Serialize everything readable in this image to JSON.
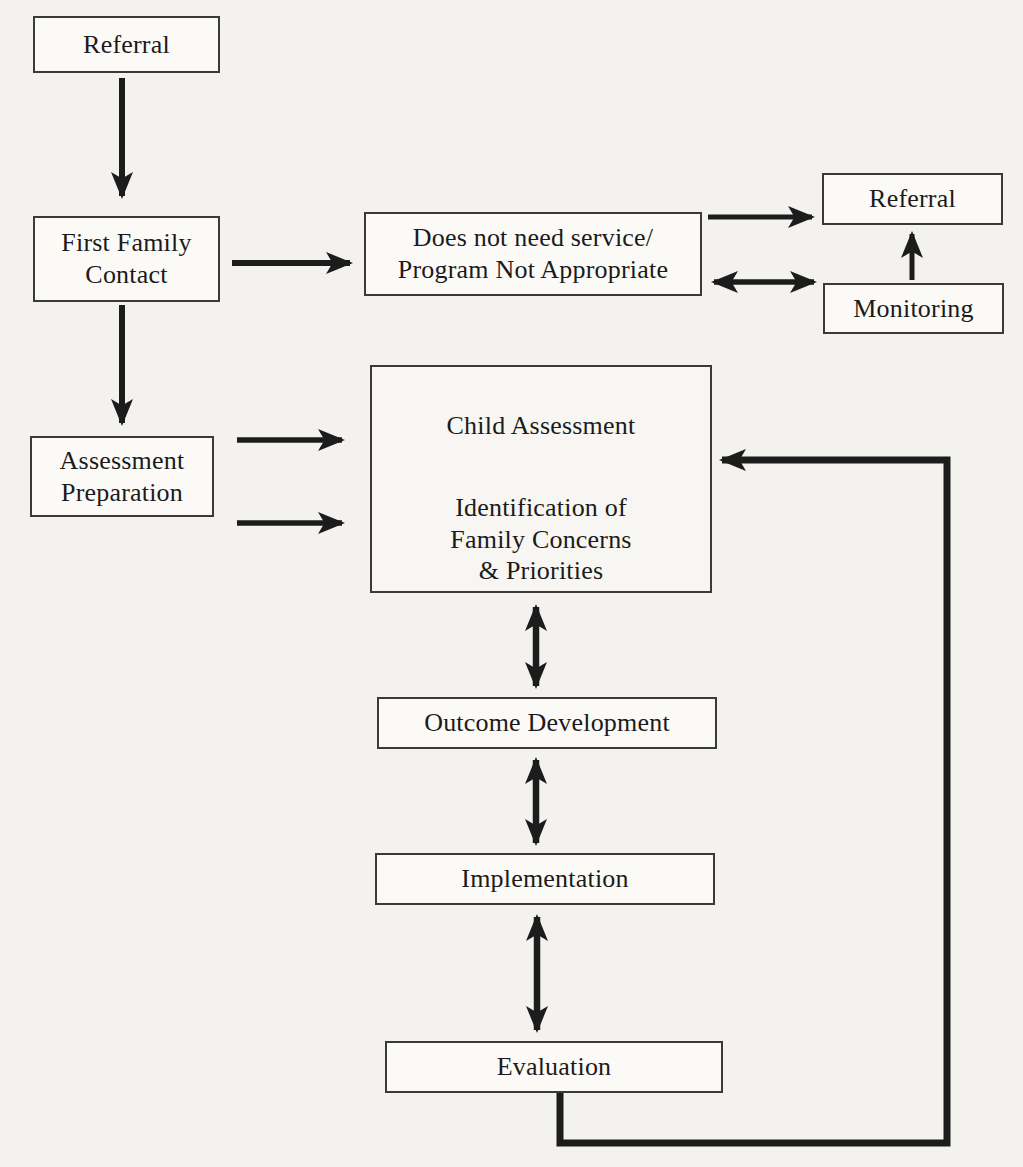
{
  "diagram": {
    "type": "flowchart",
    "colors": {
      "background": "#f3f2ee",
      "box_fill": "#fbfaf7",
      "box_border": "#3a3a38",
      "arrow": "#1c1c1c",
      "text": "#1b1b1b"
    },
    "nodes": {
      "referral_top": {
        "label": "Referral"
      },
      "first_family_contact": {
        "label": "First Family\nContact"
      },
      "does_not_need_service": {
        "label": "Does not need service/\nProgram Not Appropriate"
      },
      "referral_right": {
        "label": "Referral"
      },
      "monitoring": {
        "label": "Monitoring"
      },
      "assessment_preparation": {
        "label": "Assessment\nPreparation"
      },
      "child_assessment": {
        "label": "Child Assessment"
      },
      "family_concerns": {
        "label": "Identification of\nFamily Concerns\n& Priorities"
      },
      "outcome_development": {
        "label": "Outcome Development"
      },
      "implementation": {
        "label": "Implementation"
      },
      "evaluation": {
        "label": "Evaluation"
      }
    },
    "edges": [
      {
        "from": "referral_top",
        "to": "first_family_contact",
        "type": "single-arrow"
      },
      {
        "from": "first_family_contact",
        "to": "does_not_need_service",
        "type": "single-arrow"
      },
      {
        "from": "does_not_need_service",
        "to": "referral_right",
        "type": "single-arrow"
      },
      {
        "from": "does_not_need_service",
        "to": "monitoring",
        "type": "double-arrow"
      },
      {
        "from": "monitoring",
        "to": "referral_right",
        "type": "single-arrow"
      },
      {
        "from": "first_family_contact",
        "to": "assessment_preparation",
        "type": "single-arrow"
      },
      {
        "from": "assessment_preparation",
        "to": "assessment_group",
        "type": "single-arrow",
        "note": "upper arrow"
      },
      {
        "from": "assessment_preparation",
        "to": "assessment_group",
        "type": "single-arrow",
        "note": "lower arrow"
      },
      {
        "from": "child_assessment",
        "to": "family_concerns",
        "type": "double-arrow"
      },
      {
        "from": "assessment_group",
        "to": "outcome_development",
        "type": "double-arrow"
      },
      {
        "from": "outcome_development",
        "to": "implementation",
        "type": "double-arrow"
      },
      {
        "from": "implementation",
        "to": "evaluation",
        "type": "double-arrow"
      },
      {
        "from": "evaluation",
        "to": "assessment_group",
        "type": "single-arrow",
        "route": "down-right-up-left feedback loop"
      }
    ]
  }
}
